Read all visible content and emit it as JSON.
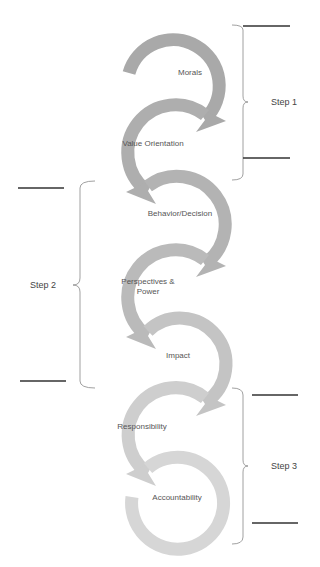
{
  "diagram": {
    "nodes": [
      {
        "label": "Morals",
        "color": "#a9a9a9",
        "cx": 190,
        "cy": 72,
        "dir": "right"
      },
      {
        "label": "Value Orientation",
        "color": "#aeaeae",
        "cx": 163,
        "cy": 145,
        "dir": "left"
      },
      {
        "label": "Behavior/Decision",
        "color": "#b3b3b3",
        "cx": 190,
        "cy": 218,
        "dir": "right"
      },
      {
        "label": "Perspectives &\nPower",
        "color": "#bababa",
        "cx": 163,
        "cy": 290,
        "dir": "left"
      },
      {
        "label": "Impact",
        "color": "#c4c4c4",
        "cx": 190,
        "cy": 357,
        "dir": "right"
      },
      {
        "label": "Responsibility",
        "color": "#cecece",
        "cx": 163,
        "cy": 427,
        "dir": "left"
      },
      {
        "label": "Accountability",
        "color": "#d6d6d6",
        "cx": 178,
        "cy": 498,
        "dir": "end"
      }
    ],
    "steps": [
      {
        "label": "Step 1"
      },
      {
        "label": "Step 2"
      },
      {
        "label": "Step 3"
      }
    ]
  }
}
